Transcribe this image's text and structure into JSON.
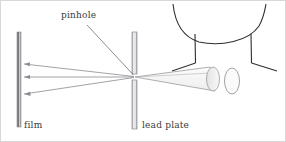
{
  "figure": {
    "background_color": "#ffffff",
    "border_color": "#d8d8d8",
    "width": 286,
    "height": 142
  },
  "labels": {
    "pinhole": "pinhole",
    "film": "film",
    "lead_plate": "lead plate"
  },
  "colors": {
    "ink": "#3a3a3a",
    "ray": "#8c8c90",
    "plate_edge": "#8c8c90",
    "plate_fill": "#e8e8e8",
    "plate_core": "#555555",
    "object_fill": "#f2f2f2",
    "object_edge": "#9a9a9e"
  },
  "elements": {
    "film_plate": {
      "name": "film",
      "x": 16,
      "y_top": 31,
      "y_bottom": 126,
      "width": 4
    },
    "lead_plate": {
      "name": "lead plate",
      "x": 131,
      "y_top": 31,
      "y_bottom": 128,
      "width": 5,
      "pinhole_y": 76
    },
    "pinhole_point": {
      "x": 134,
      "y": 76
    },
    "rays": [
      {
        "from_x": 134,
        "from_y": 76,
        "to_x": 22,
        "to_y": 63
      },
      {
        "from_x": 134,
        "from_y": 76,
        "to_x": 22,
        "to_y": 76
      },
      {
        "from_x": 134,
        "from_y": 76,
        "to_x": 22,
        "to_y": 93
      }
    ],
    "object_rays": [
      {
        "from_x": 134,
        "from_y": 76,
        "to_x": 215,
        "to_y": 64
      },
      {
        "from_x": 134,
        "from_y": 76,
        "to_x": 215,
        "to_y": 92
      }
    ],
    "subject": {
      "description": "head and shoulders outline with arm",
      "jaw_curve": "M172,3 Q176,36 205,43 Q255,41 265,3",
      "left_shoulder_vertical": {
        "x": 194,
        "y1": 33,
        "y2": 62
      },
      "left_shoulder_diagonal": {
        "x1": 194,
        "y1": 62,
        "x2": 172,
        "y2": 70
      },
      "right_shoulder_vertical": {
        "x": 250,
        "y1": 33,
        "y2": 62
      },
      "right_shoulder_diagonal": {
        "x1": 250,
        "y1": 62,
        "x2": 276,
        "y2": 70
      },
      "arm_cone_cap": {
        "cx": 213,
        "cy": 78,
        "rx": 7,
        "ry": 12
      },
      "hand_ellipse": {
        "cx": 232,
        "cy": 80,
        "rx": 8,
        "ry": 13
      }
    },
    "pointer_line": {
      "x1": 86,
      "y1": 23,
      "x2": 133,
      "y2": 74
    }
  }
}
